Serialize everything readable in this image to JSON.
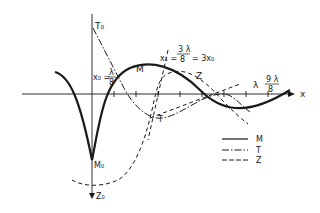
{
  "diagram": {
    "axis_x_label": "x",
    "axis_y_top_label": "T₀",
    "axis_y_bottom_label": "Z₀",
    "min_label": "M₀",
    "x0_prefix": "x₀ =",
    "x0_num": "λ",
    "x0_den": "8",
    "x1_prefix": "x₁ =",
    "x1_num": "3 λ",
    "x1_den": "8",
    "x1_suffix": "= 3x₀",
    "lambda_label": "λ",
    "nine_num": "9 λ",
    "nine_den": "8",
    "curve_labels": {
      "M": "M",
      "T": "T",
      "Z": "Z"
    },
    "legend": [
      {
        "style": "solid",
        "label": "M"
      },
      {
        "style": "dash-dot",
        "label": "T"
      },
      {
        "style": "dashed",
        "label": "Z"
      }
    ],
    "stroke_color": "#1a1a1a"
  }
}
